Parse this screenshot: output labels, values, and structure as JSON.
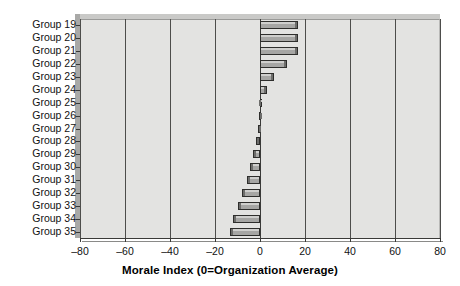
{
  "chart_data": {
    "type": "bar",
    "orientation": "horizontal",
    "title": "",
    "subtitle": "",
    "xlabel": "Morale Index (0=Organization Average)",
    "ylabel": "",
    "xlim": [
      -80,
      80
    ],
    "xticks": [
      -80,
      -60,
      -40,
      -20,
      0,
      20,
      40,
      60,
      80
    ],
    "xtick_labels": [
      "–80",
      "–60",
      "–40",
      "–20",
      "0",
      "20",
      "40",
      "60",
      "80"
    ],
    "grid": "vertical",
    "legend": "none",
    "reference_line": 0,
    "categories": [
      "Group 19",
      "Group 20",
      "Group 21",
      "Group 22",
      "Group 23",
      "Group 24",
      "Group 25",
      "Group 26",
      "Group 27",
      "Group 28",
      "Group 29",
      "Group 30",
      "Group 31",
      "Group 32",
      "Group 33",
      "Group 34",
      "Group 35"
    ],
    "values": [
      17,
      17,
      17,
      12,
      6,
      3,
      0.5,
      -0.5,
      -1,
      -2,
      -3,
      -4.5,
      -6,
      -8,
      -10,
      -12,
      -13.5
    ],
    "series": [
      {
        "name": "Morale Index",
        "values": [
          17,
          17,
          17,
          12,
          6,
          3,
          0.5,
          -0.5,
          -1,
          -2,
          -3,
          -4.5,
          -6,
          -8,
          -10,
          -12,
          -13.5
        ]
      }
    ],
    "colors": {
      "bar_fill": "#a6a6a4",
      "bar_edge": "#2e2e2c",
      "plot_background": "#e3e3e1",
      "gridline": "#4d4d4b",
      "page_background": "#ffffff",
      "text": "#111111"
    }
  },
  "axis": {
    "x_title": "Morale Index (0=Organization Average)"
  }
}
